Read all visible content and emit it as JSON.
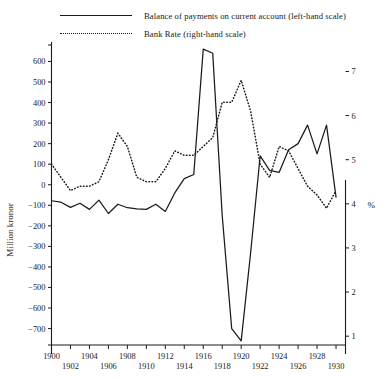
{
  "legend": {
    "items": [
      {
        "style": "solid",
        "label": "Balance of payments on current account (left-hand scale)"
      },
      {
        "style": "dotted",
        "label": "Bank Rate (right-hand scale)"
      }
    ]
  },
  "chart_data": {
    "type": "line",
    "title": "",
    "xlabel": "",
    "ylabel": "Million kronor",
    "y2label": "%",
    "xlim": [
      1900,
      1931
    ],
    "ylim": [
      -780,
      680
    ],
    "y2lim": [
      0.8,
      7.6
    ],
    "grid": false,
    "legend_position": "top",
    "yticks": [
      600,
      500,
      400,
      300,
      200,
      100,
      0,
      -100,
      -200,
      -300,
      -400,
      -500,
      -600,
      -700
    ],
    "ytick_labels": [
      "600",
      "500",
      "400",
      "300",
      "200",
      "100",
      "0",
      "−100",
      "−200",
      "−300",
      "−400",
      "−500",
      "−600",
      "−700"
    ],
    "y2ticks": [
      7,
      6,
      5,
      4,
      3,
      2,
      1
    ],
    "y2tick_labels": [
      "7",
      "6",
      "5",
      "4",
      "3",
      "2",
      "1"
    ],
    "xticks": [
      1900,
      1902,
      1904,
      1906,
      1908,
      1910,
      1912,
      1914,
      1916,
      1918,
      1920,
      1922,
      1924,
      1926,
      1928,
      1930
    ],
    "xtick_labels_upper": [
      "1900",
      "1904",
      "1908",
      "1912",
      "1916",
      "1920",
      "1924",
      "1928"
    ],
    "xtick_labels_lower": [
      "1902",
      "1906",
      "1910",
      "1914",
      "1918",
      "1922",
      "1926",
      "1930"
    ],
    "x": [
      1900,
      1901,
      1902,
      1903,
      1904,
      1905,
      1906,
      1907,
      1908,
      1909,
      1910,
      1911,
      1912,
      1913,
      1914,
      1915,
      1916,
      1917,
      1918,
      1919,
      1920,
      1921,
      1922,
      1923,
      1924,
      1925,
      1926,
      1927,
      1928,
      1929,
      1930
    ],
    "series": [
      {
        "name": "Balance of payments on current account",
        "axis": "left",
        "unit": "Million kronor",
        "style": "solid",
        "values": [
          -78,
          -85,
          -110,
          -90,
          -120,
          -75,
          -140,
          -95,
          -112,
          -118,
          -120,
          -95,
          -130,
          -40,
          30,
          50,
          660,
          640,
          -150,
          -700,
          -760,
          -330,
          140,
          70,
          60,
          170,
          200,
          290,
          150,
          290,
          -60
        ]
      },
      {
        "name": "Bank Rate",
        "axis": "right",
        "unit": "%",
        "style": "dotted",
        "values": [
          4.9,
          4.6,
          4.3,
          4.4,
          4.4,
          4.5,
          5.0,
          5.6,
          5.3,
          4.6,
          4.5,
          4.5,
          4.8,
          5.2,
          5.1,
          5.1,
          5.3,
          5.5,
          6.3,
          6.3,
          6.8,
          6.1,
          4.9,
          4.6,
          5.3,
          5.2,
          4.8,
          4.4,
          4.2,
          3.9,
          4.3
        ]
      }
    ]
  }
}
